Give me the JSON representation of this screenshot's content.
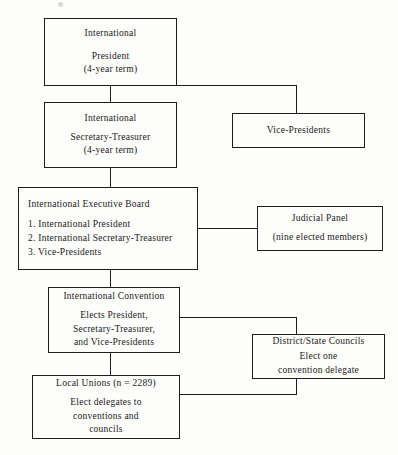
{
  "figure": {
    "line_color": "#1d1d1d",
    "background_color": "#fdfdfc"
  },
  "nodes": {
    "international_president": {
      "title": "International",
      "line2": "President",
      "line3": "(4-year term)"
    },
    "international_secretary_treasurer": {
      "title": "International",
      "line2": "Secretary-Treasurer",
      "line3": "(4-year term)"
    },
    "vice_presidents": {
      "title": "Vice-Presidents"
    },
    "international_executive_board": {
      "title": "International Executive Board",
      "item1": "1.  International President",
      "item2": "2.  International Secretary-Treasurer",
      "item3": "3.  Vice-Presidents"
    },
    "judicial_panel": {
      "title": "Judicial Panel",
      "line2": "(nine elected members)"
    },
    "international_convention": {
      "title": "International Convention",
      "line2": "Elects President,",
      "line3": "Secretary-Treasurer,",
      "line4": "and Vice-Presidents"
    },
    "district_state_councils": {
      "title": "District/State Councils",
      "line2": "Elect one",
      "line3": "convention delegate"
    },
    "local_unions": {
      "title": "Local Unions (n = 2289)",
      "line2": "Elect delegates to",
      "line3": "conventions and",
      "line4": "councils"
    }
  }
}
